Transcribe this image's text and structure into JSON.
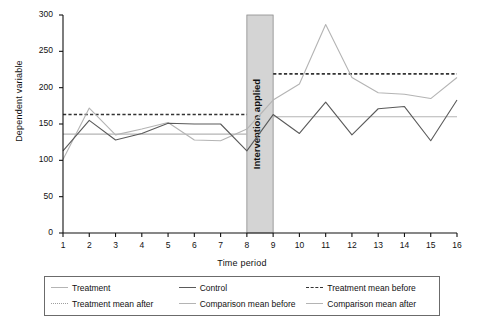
{
  "chart_data": {
    "type": "line",
    "title": "",
    "xlabel": "Time period",
    "ylabel": "Dependent variable",
    "x": [
      1,
      2,
      3,
      4,
      5,
      6,
      7,
      8,
      9,
      10,
      11,
      12,
      13,
      14,
      15,
      16
    ],
    "xlim": [
      1,
      16
    ],
    "ylim": [
      0,
      300
    ],
    "yticks": [
      0,
      50,
      100,
      150,
      200,
      250,
      300
    ],
    "xticks": [
      "1",
      "2",
      "3",
      "4",
      "5",
      "6",
      "7",
      "8",
      "9",
      "10",
      "11",
      "12",
      "13",
      "14",
      "15",
      "16"
    ],
    "grid": false,
    "legend_position": "below",
    "series": [
      {
        "name": "Treatment",
        "style": "solid",
        "color": "#b4b4b4",
        "values": [
          101,
          172,
          135,
          143,
          152,
          128,
          127,
          143,
          183,
          205,
          287,
          214,
          193,
          191,
          185,
          214
        ]
      },
      {
        "name": "Control",
        "style": "solid",
        "color": "#5a5a5a",
        "values": [
          113,
          155,
          128,
          137,
          151,
          150,
          150,
          113,
          163,
          137,
          180,
          135,
          171,
          174,
          127,
          183
        ]
      }
    ],
    "reference_lines": [
      {
        "name": "Treatment mean before",
        "style": "dashed",
        "color": "#333333",
        "value": 163,
        "x_from": 1,
        "x_to": 8
      },
      {
        "name": "Treatment mean after",
        "style": "dashed",
        "color": "#333333",
        "value": 219,
        "x_from": 9,
        "x_to": 16
      },
      {
        "name": "Comparison mean before",
        "style": "solid",
        "color": "#b4b4b4",
        "value": 136,
        "x_from": 1,
        "x_to": 8
      },
      {
        "name": "Comparison mean after",
        "style": "solid",
        "color": "#b4b4b4",
        "value": 160,
        "x_from": 9,
        "x_to": 16
      }
    ],
    "annotations": [
      {
        "text": "Intervention applied",
        "type": "vertical-band",
        "x_from": 8,
        "x_to": 9,
        "color": "#d4d4d4"
      }
    ]
  },
  "legend": {
    "items": [
      {
        "label": "Treatment",
        "swatch": "sw-solid-light"
      },
      {
        "label": "Control",
        "swatch": "sw-solid-dark"
      },
      {
        "label": "Treatment mean before",
        "swatch": "sw-dash-dark"
      },
      {
        "label": "Treatment mean after",
        "swatch": "sw-dot-light"
      },
      {
        "label": "Comparison mean before",
        "swatch": "sw-solid-light"
      },
      {
        "label": "Comparison mean after",
        "swatch": "sw-solid-light"
      }
    ]
  }
}
